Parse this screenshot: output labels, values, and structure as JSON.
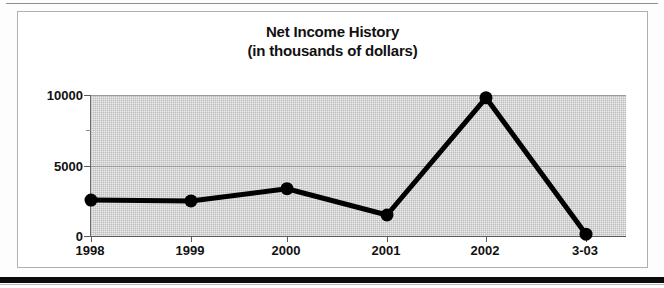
{
  "page": {
    "background": "#fdfdfd",
    "top_rule_color": "#8e8e8e",
    "bottom_rule_color": "#0b0b0b"
  },
  "chart": {
    "title_line1": "Net Income History",
    "title_line2": "(in thousands of dollars)",
    "frame_color": "#b0b0b0",
    "plot_background": "#ededed",
    "series_color": "#000000"
  },
  "chart_data": {
    "type": "line",
    "title": "Net Income History (in thousands of dollars)",
    "xlabel": "",
    "ylabel": "",
    "categories": [
      "1998",
      "1999",
      "2000",
      "2001",
      "2002",
      "3-03"
    ],
    "values": [
      2600,
      2540,
      3400,
      1550,
      9800,
      200
    ],
    "ylim": [
      0,
      10000
    ],
    "yticks": [
      0,
      5000,
      10000
    ],
    "ytick_labels": [
      "0",
      "5000",
      "10000"
    ],
    "yminor_ticks": [
      2500,
      7500
    ],
    "grid": true,
    "legend": null,
    "marker": "filled-circle",
    "units": "thousands of dollars"
  }
}
